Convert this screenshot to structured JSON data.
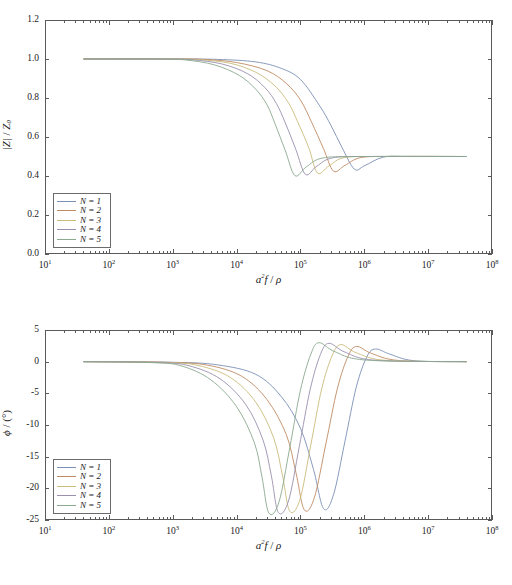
{
  "figure": {
    "background": "#ffffff",
    "axis_color": "#5a5a5a",
    "panels": [
      "magnitude",
      "phase"
    ]
  },
  "series_colors": [
    "#7b90b5",
    "#c08a63",
    "#c9bb7a",
    "#9a8fae",
    "#8aa98f"
  ],
  "legend": {
    "position": "lower-left",
    "entries": [
      {
        "label": "N = 1",
        "color": "#7b90b5"
      },
      {
        "label": "N = 2",
        "color": "#c08a63"
      },
      {
        "label": "N = 3",
        "color": "#c9bb7a"
      },
      {
        "label": "N = 4",
        "color": "#9a8fae"
      },
      {
        "label": "N = 5",
        "color": "#8aa98f"
      }
    ]
  },
  "chart_data": [
    {
      "type": "line",
      "id": "magnitude",
      "title": "",
      "xlabel": "a²f / ρ",
      "ylabel": "|Z| / Z₀",
      "xscale": "log",
      "xlim": [
        10,
        100000000
      ],
      "ylim": [
        0.0,
        1.2
      ],
      "yticks": [
        0.0,
        0.2,
        0.4,
        0.6,
        0.8,
        1.0,
        1.2
      ],
      "ytick_labels": [
        "0.0",
        "0.2",
        "0.4",
        "0.6",
        "0.8",
        "1.0",
        "1.2"
      ],
      "xticks": [
        10,
        100,
        1000,
        10000,
        100000,
        1000000,
        10000000,
        100000000
      ],
      "xtick_labels": [
        "10¹",
        "10²",
        "10³",
        "10⁴",
        "10⁵",
        "10⁶",
        "10⁷",
        "10⁸"
      ],
      "grid": false,
      "legend_position": "lower left",
      "plateau_low": 1.0,
      "plateau_high": 0.5,
      "undershoot_min": 0.4,
      "data_x_start": 40,
      "data_x_end": 40000000,
      "series": [
        {
          "name": "N = 1",
          "color": "#7b90b5",
          "transition_center_x": 300000,
          "undershoot_x": 700000,
          "undershoot_y": 0.435,
          "x": [
            40,
            1000,
            5000,
            20000,
            50000,
            100000,
            200000,
            300000,
            450000,
            700000,
            1000000,
            2000000,
            5000000,
            40000000
          ],
          "y": [
            1.0,
            1.0,
            0.998,
            0.985,
            0.952,
            0.895,
            0.76,
            0.66,
            0.545,
            0.435,
            0.452,
            0.497,
            0.5,
            0.5
          ]
        },
        {
          "name": "N = 2",
          "color": "#c08a63",
          "transition_center_x": 150000,
          "undershoot_x": 330000,
          "undershoot_y": 0.425,
          "x": [
            40,
            1000,
            3000,
            10000,
            30000,
            60000,
            100000,
            150000,
            230000,
            330000,
            500000,
            900000,
            3000000,
            40000000
          ],
          "y": [
            1.0,
            1.0,
            0.998,
            0.982,
            0.94,
            0.875,
            0.79,
            0.675,
            0.54,
            0.425,
            0.455,
            0.495,
            0.5,
            0.5
          ]
        },
        {
          "name": "N = 3",
          "color": "#c9bb7a",
          "transition_center_x": 90000,
          "undershoot_x": 185000,
          "undershoot_y": 0.415,
          "x": [
            40,
            800,
            2500,
            8000,
            20000,
            40000,
            65000,
            90000,
            135000,
            185000,
            280000,
            500000,
            2000000,
            40000000
          ],
          "y": [
            1.0,
            1.0,
            0.997,
            0.978,
            0.932,
            0.862,
            0.775,
            0.68,
            0.545,
            0.415,
            0.452,
            0.495,
            0.5,
            0.5
          ]
        },
        {
          "name": "N = 4",
          "color": "#9a8fae",
          "transition_center_x": 58000,
          "undershoot_x": 120000,
          "undershoot_y": 0.408,
          "x": [
            40,
            700,
            2000,
            6000,
            15000,
            28000,
            42000,
            58000,
            85000,
            120000,
            180000,
            330000,
            1500000,
            40000000
          ],
          "y": [
            1.0,
            1.0,
            0.996,
            0.974,
            0.924,
            0.852,
            0.772,
            0.672,
            0.535,
            0.408,
            0.45,
            0.494,
            0.5,
            0.5
          ]
        },
        {
          "name": "N = 5",
          "color": "#8aa98f",
          "transition_center_x": 40000,
          "undershoot_x": 82000,
          "undershoot_y": 0.402,
          "x": [
            40,
            600,
            1600,
            4500,
            11000,
            20000,
            30000,
            40000,
            58000,
            82000,
            125000,
            230000,
            1100000,
            40000000
          ],
          "y": [
            1.0,
            1.0,
            0.995,
            0.97,
            0.916,
            0.845,
            0.765,
            0.668,
            0.53,
            0.402,
            0.448,
            0.493,
            0.5,
            0.5
          ]
        }
      ]
    },
    {
      "type": "line",
      "id": "phase",
      "title": "",
      "xlabel": "a²f / ρ",
      "ylabel": "φ / (°)",
      "xscale": "log",
      "xlim": [
        10,
        100000000
      ],
      "ylim": [
        -25,
        5
      ],
      "yticks": [
        5,
        0,
        -5,
        -10,
        -15,
        -20,
        -25
      ],
      "ytick_labels": [
        "5",
        "0",
        "-5",
        "-10",
        "-15",
        "-20",
        "-25"
      ],
      "xticks": [
        10,
        100,
        1000,
        10000,
        100000,
        1000000,
        10000000,
        100000000
      ],
      "xtick_labels": [
        "10¹",
        "10²",
        "10³",
        "10⁴",
        "10⁵",
        "10⁶",
        "10⁷",
        "10⁸"
      ],
      "grid": false,
      "legend_position": "lower left",
      "baseline": 0,
      "minimum_phase": -23,
      "overshoot_peak": 3,
      "data_x_start": 40,
      "data_x_end": 40000000,
      "series": [
        {
          "name": "N = 1",
          "color": "#7b90b5",
          "min_x": 230000,
          "min_y": -23.2,
          "peak_x": 1500000,
          "peak_y": 2.0,
          "x": [
            40,
            1000,
            5000,
            20000,
            50000,
            100000,
            160000,
            230000,
            330000,
            500000,
            750000,
            1100000,
            1500000,
            2500000,
            6000000,
            40000000
          ],
          "y": [
            0,
            -0.1,
            -0.5,
            -2.0,
            -5.5,
            -10.5,
            -17.0,
            -23.2,
            -21.0,
            -12.5,
            -4.0,
            0.8,
            2.0,
            1.2,
            0.15,
            0.0
          ]
        },
        {
          "name": "N = 2",
          "color": "#c08a63",
          "min_x": 115000,
          "min_y": -23.4,
          "peak_x": 760000,
          "peak_y": 2.4,
          "x": [
            40,
            800,
            3500,
            12000,
            30000,
            60000,
            85000,
            115000,
            165000,
            250000,
            380000,
            560000,
            760000,
            1300000,
            3500000,
            40000000
          ],
          "y": [
            0,
            -0.1,
            -0.55,
            -2.3,
            -6.0,
            -11.5,
            -17.5,
            -23.4,
            -21.5,
            -13.0,
            -4.2,
            0.9,
            2.4,
            1.3,
            0.18,
            0.0
          ]
        },
        {
          "name": "N = 3",
          "color": "#c9bb7a",
          "min_x": 68000,
          "min_y": -23.6,
          "peak_x": 430000,
          "peak_y": 2.7,
          "x": [
            40,
            700,
            2500,
            8000,
            20000,
            38000,
            52000,
            68000,
            98000,
            145000,
            215000,
            315000,
            430000,
            750000,
            2200000,
            40000000
          ],
          "y": [
            0,
            -0.12,
            -0.6,
            -2.5,
            -6.4,
            -12.0,
            -17.8,
            -23.6,
            -21.8,
            -13.2,
            -4.3,
            1.0,
            2.7,
            1.4,
            0.2,
            0.0
          ]
        },
        {
          "name": "N = 4",
          "color": "#9a8fae",
          "min_x": 45000,
          "min_y": -23.8,
          "peak_x": 280000,
          "peak_y": 2.9,
          "x": [
            40,
            600,
            1800,
            5500,
            14000,
            26000,
            35000,
            45000,
            65000,
            96000,
            142000,
            205000,
            280000,
            500000,
            1500000,
            40000000
          ],
          "y": [
            0,
            -0.14,
            -0.65,
            -2.7,
            -6.8,
            -12.4,
            -18.0,
            -23.8,
            -22.0,
            -13.4,
            -4.4,
            1.1,
            2.9,
            1.5,
            0.22,
            0.0
          ]
        },
        {
          "name": "N = 5",
          "color": "#8aa98f",
          "min_x": 32000,
          "min_y": -23.9,
          "peak_x": 195000,
          "peak_y": 3.0,
          "x": [
            40,
            500,
            1400,
            4000,
            10000,
            19000,
            25000,
            32000,
            46000,
            68000,
            100000,
            145000,
            195000,
            350000,
            1100000,
            40000000
          ],
          "y": [
            0,
            -0.16,
            -0.7,
            -2.9,
            -7.1,
            -12.8,
            -18.2,
            -23.9,
            -22.2,
            -13.6,
            -4.5,
            1.15,
            3.0,
            1.55,
            0.24,
            0.0
          ]
        }
      ]
    }
  ]
}
